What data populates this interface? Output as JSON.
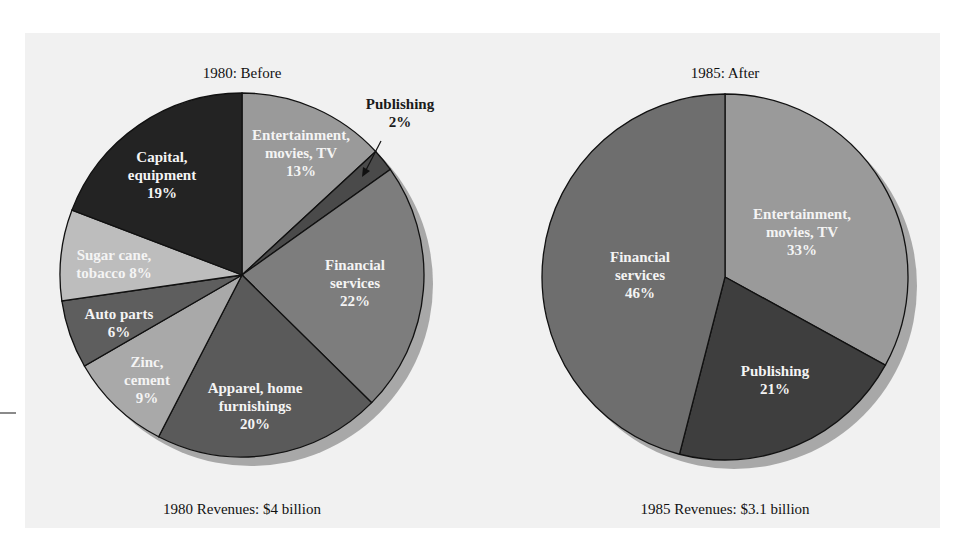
{
  "chart_data": [
    {
      "type": "pie",
      "title": "1980: Before",
      "caption": "1980 Revenues: $4 billion",
      "start_angle_deg": 0,
      "direction": "clockwise",
      "slices": [
        {
          "label": "Entertainment, movies, TV",
          "lines": [
            "Entertainment,",
            "movies, TV",
            "13%"
          ],
          "value": 13,
          "color": "#9a9a9a"
        },
        {
          "label": "Publishing",
          "lines": [
            "Publishing",
            "2%"
          ],
          "value": 2,
          "color": "#4a4a4a",
          "external_label": true
        },
        {
          "label": "Financial services",
          "lines": [
            "Financial",
            "services",
            "22%"
          ],
          "value": 22,
          "color": "#7d7d7d"
        },
        {
          "label": "Apparel, home furnishings",
          "lines": [
            "Apparel, home",
            "furnishings",
            "20%"
          ],
          "value": 20,
          "color": "#5a5a5a"
        },
        {
          "label": "Zinc, cement",
          "lines": [
            "Zinc,",
            "cement",
            "9%"
          ],
          "value": 9,
          "color": "#a9a9a9"
        },
        {
          "label": "Auto parts",
          "lines": [
            "Auto parts",
            "6%"
          ],
          "value": 6,
          "color": "#5e5e5e"
        },
        {
          "label": "Sugar cane, tobacco",
          "lines": [
            "Sugar cane,",
            "tobacco 8%"
          ],
          "value": 8,
          "color": "#bdbdbd"
        },
        {
          "label": "Capital, equipment",
          "lines": [
            "Capital,",
            "equipment",
            "19%"
          ],
          "value": 19,
          "color": "#232323"
        }
      ]
    },
    {
      "type": "pie",
      "title": "1985: After",
      "caption": "1985 Revenues: $3.1 billion",
      "start_angle_deg": 0,
      "direction": "clockwise",
      "slices": [
        {
          "label": "Entertainment, movies, TV",
          "lines": [
            "Entertainment,",
            "movies, TV",
            "33%"
          ],
          "value": 33,
          "color": "#9a9a9a"
        },
        {
          "label": "Publishing",
          "lines": [
            "Publishing",
            "21%"
          ],
          "value": 21,
          "color": "#3e3e3e"
        },
        {
          "label": "Financial services",
          "lines": [
            "Financial",
            "services",
            "46%"
          ],
          "value": 46,
          "color": "#6e6e6e"
        }
      ]
    }
  ],
  "titles": {
    "left": "1980: Before",
    "right": "1985: After"
  },
  "captions": {
    "left": "1980 Revenues: $4 billion",
    "right": "1985 Revenues: $3.1 billion"
  }
}
